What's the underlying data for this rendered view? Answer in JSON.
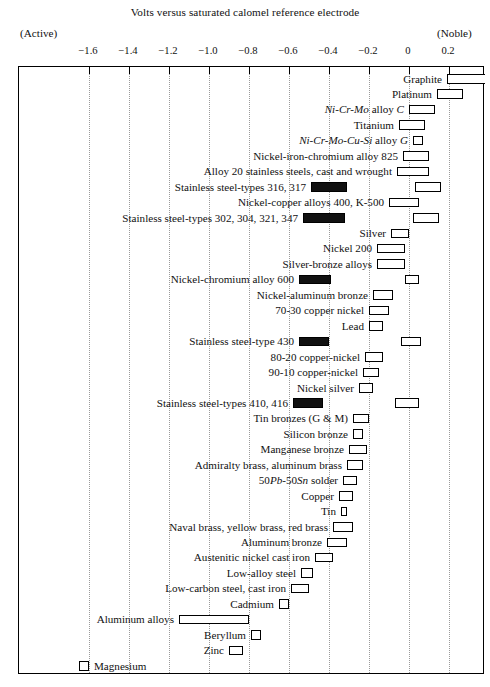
{
  "caption": "Volts versus saturated calomel reference electrode",
  "active_label": "(Active)",
  "noble_label": "(Noble)",
  "chart_data": {
    "type": "bar",
    "orientation": "horizontal-range",
    "title": "Volts versus saturated calomel reference electrode",
    "subtitle": "Galvanic series in seawater",
    "xlabel": "Volts versus saturated calomel reference electrode",
    "ylabel": "",
    "xlim": [
      -1.75,
      0.32
    ],
    "grid": "vertical-dotted",
    "legend": "none",
    "annotations": [
      "(Active)",
      "(Noble)"
    ],
    "axis_ticks": [
      {
        "label": "−1.6",
        "value": -1.6
      },
      {
        "label": "−1.4",
        "value": -1.4
      },
      {
        "label": "−1.2",
        "value": -1.2
      },
      {
        "label": "−1.0",
        "value": -1.0
      },
      {
        "label": "−0.8",
        "value": -0.8
      },
      {
        "label": "−0.6",
        "value": -0.6
      },
      {
        "label": "−0.4",
        "value": -0.4
      },
      {
        "label": "−0.2",
        "value": -0.2
      },
      {
        "label": "0",
        "value": 0.0
      },
      {
        "label": "0.2",
        "value": 0.2
      }
    ],
    "categories": [
      "Graphite",
      "Platinum",
      "Ni-Cr-Mo alloy C",
      "Titanium",
      "Ni-Cr-Mo-Cu-Si alloy G",
      "Nickel-iron-chromium alloy 825",
      "Alloy 20 stainless steels, cast and wrought",
      "Stainless steel-types 316, 317",
      "Nickel-copper alloys 400, K-500",
      "Stainless steel-types 302, 304, 321, 347",
      "Silver",
      "Nickel 200",
      "Silver-bronze alloys",
      "Nickel-chromium alloy 600",
      "Nickel-aluminum bronze",
      "70-30 copper nickel",
      "Lead",
      "Stainless steel-type 430",
      "80-20 copper-nickel",
      "90-10 copper-nickel",
      "Nickel silver",
      "Stainless steel-types 410, 416",
      "Tin bronzes (G & M)",
      "Silicon bronze",
      "Manganese bronze",
      "Admiralty brass, aluminum brass",
      "50Pb-50Sn solder",
      "Copper",
      "Tin",
      "Naval brass, yellow brass, red brass",
      "Aluminum bronze",
      "Austenitic nickel cast iron",
      "Low-alloy steel",
      "Low-carbon steel, cast iron",
      "Cadmium",
      "Aluminum alloys",
      "Beryllum",
      "Zinc",
      "Magnesium"
    ],
    "series": [
      {
        "name": "Potential range (passive / normal)",
        "style": "hollow",
        "ranges": [
          [
            0.19,
            0.38
          ],
          [
            0.14,
            0.27
          ],
          [
            0.0,
            0.13
          ],
          [
            -0.05,
            0.08
          ],
          [
            0.02,
            0.07
          ],
          [
            -0.03,
            0.1
          ],
          [
            -0.06,
            0.1
          ],
          [
            0.03,
            0.16
          ],
          [
            -0.1,
            0.05
          ],
          [
            0.02,
            0.15
          ],
          [
            -0.09,
            0.0
          ],
          [
            -0.16,
            -0.02
          ],
          [
            -0.16,
            -0.02
          ],
          [
            -0.02,
            0.05
          ],
          [
            -0.18,
            -0.08
          ],
          [
            -0.2,
            -0.1
          ],
          [
            -0.2,
            -0.13
          ],
          [
            -0.04,
            0.06
          ],
          [
            -0.22,
            -0.13
          ],
          [
            -0.23,
            -0.15
          ],
          [
            -0.25,
            -0.18
          ],
          [
            -0.07,
            0.05
          ],
          [
            -0.28,
            -0.2
          ],
          [
            -0.28,
            -0.23
          ],
          [
            -0.3,
            -0.21
          ],
          [
            -0.31,
            -0.23
          ],
          [
            -0.33,
            -0.26
          ],
          [
            -0.35,
            -0.28
          ],
          [
            -0.34,
            -0.31
          ],
          [
            -0.38,
            -0.28
          ],
          [
            -0.41,
            -0.31
          ],
          [
            -0.47,
            -0.38
          ],
          [
            -0.54,
            -0.48
          ],
          [
            -0.59,
            -0.5
          ],
          [
            -0.65,
            -0.6
          ],
          [
            -1.15,
            -0.8
          ],
          [
            -0.79,
            -0.74
          ],
          [
            -0.9,
            -0.83
          ],
          [
            -1.65,
            -1.6
          ]
        ]
      },
      {
        "name": "Active (depassivated) potential range",
        "style": "filled",
        "ranges": [
          null,
          null,
          null,
          null,
          null,
          null,
          null,
          [
            -0.49,
            -0.31
          ],
          null,
          [
            -0.53,
            -0.32
          ],
          null,
          null,
          null,
          [
            -0.55,
            -0.39
          ],
          null,
          null,
          null,
          [
            -0.55,
            -0.4
          ],
          null,
          null,
          null,
          [
            -0.58,
            -0.43
          ],
          null,
          null,
          null,
          null,
          null,
          null,
          null,
          null,
          null,
          null,
          null,
          null,
          null,
          null,
          null,
          null,
          null
        ]
      }
    ]
  }
}
